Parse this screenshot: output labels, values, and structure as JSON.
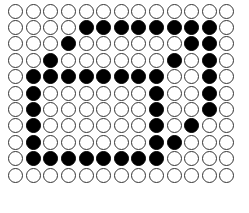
{
  "diagram": {
    "type": "dot-matrix",
    "rows": 11,
    "columns": 13,
    "colors": {
      "filled": "#000000",
      "empty_fill": "#ffffff",
      "empty_stroke": "#333333",
      "background": "#ffffff"
    },
    "legend": {
      "filled_label": "filled",
      "empty_label": "empty"
    },
    "cell_states": [
      [
        0,
        0,
        0,
        0,
        0,
        0,
        0,
        0,
        0,
        0,
        0,
        0,
        0
      ],
      [
        0,
        0,
        0,
        0,
        1,
        1,
        1,
        1,
        1,
        1,
        1,
        1,
        0
      ],
      [
        0,
        0,
        0,
        1,
        0,
        0,
        0,
        0,
        0,
        0,
        1,
        1,
        0
      ],
      [
        0,
        0,
        1,
        0,
        0,
        0,
        0,
        0,
        0,
        1,
        0,
        1,
        0
      ],
      [
        0,
        1,
        1,
        1,
        1,
        1,
        1,
        1,
        1,
        0,
        0,
        1,
        0
      ],
      [
        0,
        1,
        0,
        0,
        0,
        0,
        0,
        0,
        1,
        0,
        0,
        1,
        0
      ],
      [
        0,
        1,
        0,
        0,
        0,
        0,
        0,
        0,
        1,
        0,
        0,
        1,
        0
      ],
      [
        0,
        1,
        0,
        0,
        0,
        0,
        0,
        0,
        1,
        0,
        1,
        0,
        0
      ],
      [
        0,
        1,
        0,
        0,
        0,
        0,
        0,
        0,
        1,
        1,
        0,
        0,
        0
      ],
      [
        0,
        1,
        1,
        1,
        1,
        1,
        1,
        1,
        1,
        0,
        0,
        0,
        0
      ],
      [
        0,
        0,
        0,
        0,
        0,
        0,
        0,
        0,
        0,
        0,
        0,
        0,
        0
      ]
    ]
  }
}
